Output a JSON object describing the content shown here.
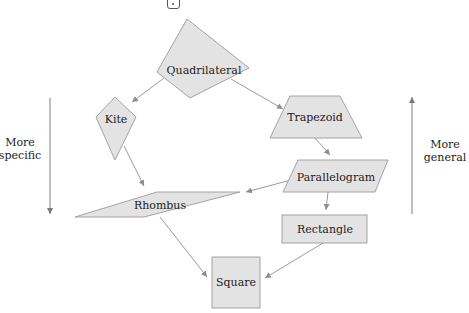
{
  "toolbar": {
    "icon": "dice-icon"
  },
  "diagram": {
    "nodes": {
      "quadrilateral": "Quadrilateral",
      "kite": "Kite",
      "trapezoid": "Trapezoid",
      "parallelogram": "Parallelogram",
      "rhombus": "Rhombus",
      "rectangle": "Rectangle",
      "square": "Square"
    },
    "edges": [
      {
        "from": "Quadrilateral",
        "to": "Kite"
      },
      {
        "from": "Quadrilateral",
        "to": "Trapezoid"
      },
      {
        "from": "Trapezoid",
        "to": "Parallelogram"
      },
      {
        "from": "Kite",
        "to": "Rhombus"
      },
      {
        "from": "Parallelogram",
        "to": "Rhombus"
      },
      {
        "from": "Parallelogram",
        "to": "Rectangle"
      },
      {
        "from": "Rhombus",
        "to": "Square"
      },
      {
        "from": "Rectangle",
        "to": "Square"
      }
    ],
    "left_axis_label": "More\nspecific",
    "right_axis_label": "More\ngeneral"
  },
  "colors": {
    "shape_fill": "#e3e3e3",
    "shape_stroke": "#9a9a9a",
    "edge": "#8e8e8e",
    "text": "#222222"
  }
}
